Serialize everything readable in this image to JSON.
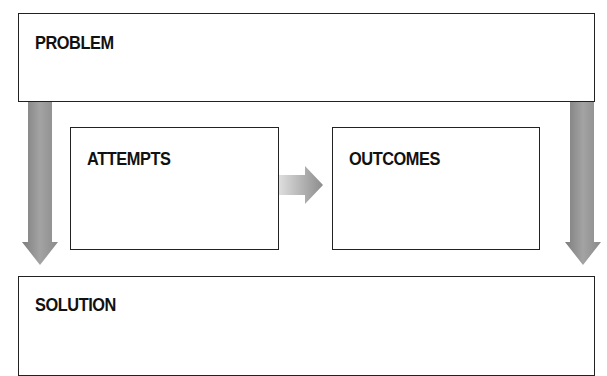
{
  "diagram": {
    "boxes": {
      "problem": {
        "label": "PROBLEM"
      },
      "attempts": {
        "label": "ATTEMPTS"
      },
      "outcomes": {
        "label": "OUTCOMES"
      },
      "solution": {
        "label": "SOLUTION"
      }
    },
    "arrows": [
      {
        "from": "problem",
        "to": "solution",
        "side": "left",
        "direction": "down"
      },
      {
        "from": "attempts",
        "to": "outcomes",
        "direction": "right"
      },
      {
        "from": "problem",
        "to": "solution",
        "side": "right",
        "direction": "down"
      }
    ],
    "colors": {
      "border": "#222222",
      "arrow": "#8c8c8c",
      "arrow_light": "#d8d8d8",
      "background": "#ffffff"
    }
  }
}
